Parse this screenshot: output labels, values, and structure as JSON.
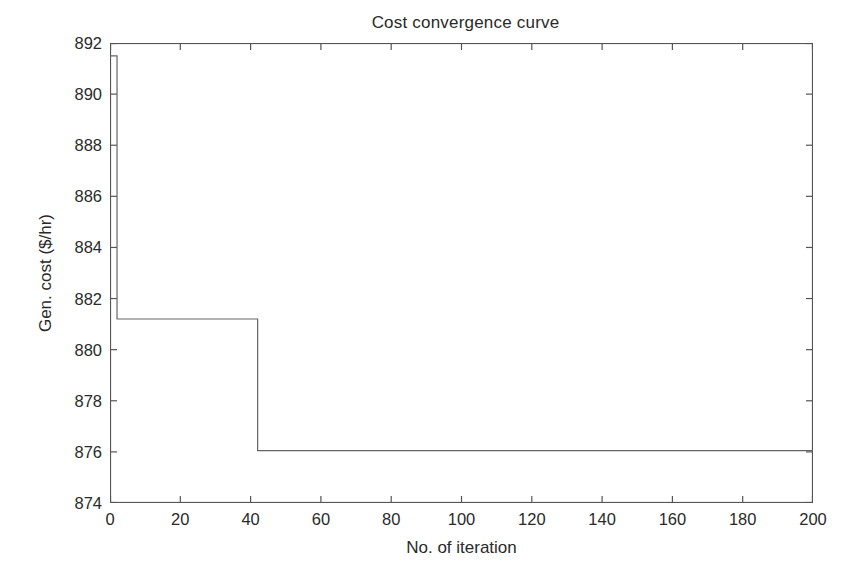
{
  "figure": {
    "background_color": "#ffffff",
    "axes_color": "#555555",
    "line_color": "#666666",
    "text_color": "#2a2a2a"
  },
  "title": "Cost convergence curve",
  "axes": {
    "x_label": "No. of iteration",
    "y_label": "Gen. cost ($/hr)",
    "x_ticks": [
      "0",
      "20",
      "40",
      "60",
      "80",
      "100",
      "120",
      "140",
      "160",
      "180",
      "200"
    ],
    "y_ticks": [
      "874",
      "876",
      "878",
      "880",
      "882",
      "884",
      "886",
      "888",
      "890",
      "892"
    ]
  },
  "chart_data": {
    "type": "line",
    "title": "Cost convergence curve",
    "xlabel": "No. of iteration",
    "ylabel": "Gen. cost ($/hr)",
    "xlim": [
      0,
      200
    ],
    "ylim": [
      874,
      892
    ],
    "xticks": [
      0,
      20,
      40,
      60,
      80,
      100,
      120,
      140,
      160,
      180,
      200
    ],
    "yticks": [
      874,
      876,
      878,
      880,
      882,
      884,
      886,
      888,
      890,
      892
    ],
    "grid": false,
    "legend": null,
    "line_style": "step-post",
    "series": [
      {
        "name": "Gen. cost",
        "x": [
          0,
          2,
          2,
          42,
          42,
          200
        ],
        "values": [
          891.5,
          891.5,
          881.2,
          881.2,
          876.05,
          876.05
        ]
      }
    ],
    "annotations": [
      "Initial cost 891.5 $/hr at iteration 0",
      "First drop to 881.2 $/hr at iteration 2",
      "Second drop to 876.05 $/hr at iteration 42",
      "Converged value 876.05 $/hr held to iteration 200"
    ]
  }
}
